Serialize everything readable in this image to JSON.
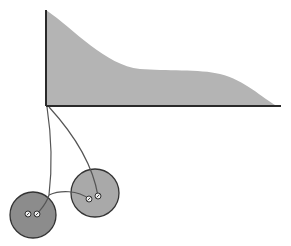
{
  "diagram": {
    "colors": {
      "background": "#ffffff",
      "curve_fill": "#b4b4b4",
      "axis_stroke": "#2a2a2a",
      "thread_stroke": "#555555",
      "button_left_fill": "#8c8c8c",
      "button_right_fill": "#a9a9a9",
      "button_stroke": "#333333",
      "hole_fill": "#f2f2f2"
    },
    "axis": {
      "origin": [
        46,
        106
      ],
      "top": [
        46,
        10
      ],
      "right": [
        281,
        106
      ]
    },
    "curve_path": "M46,10 C75,30 105,65 140,69 C165,71 200,69 220,74 C245,80 262,98 277,106 L46,106 Z",
    "buttons": [
      {
        "name": "left-button",
        "cx": 33,
        "cy": 215,
        "r": 23,
        "holes": [
          [
            28,
            214
          ],
          [
            37,
            214
          ]
        ]
      },
      {
        "name": "right-button",
        "cx": 95,
        "cy": 193,
        "r": 24,
        "holes": [
          [
            89,
            199
          ],
          [
            98,
            196
          ]
        ]
      }
    ],
    "threads": [
      "M47,107 C52,140 52,170 49,195 C46,205 40,210 37,214",
      "M49,195 C60,190 78,190 89,199",
      "M49,107 C70,130 92,160 98,196"
    ]
  }
}
